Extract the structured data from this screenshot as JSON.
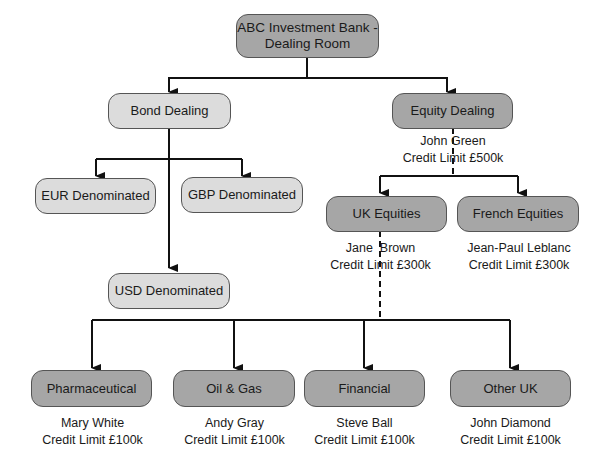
{
  "root": {
    "title_line1": "ABC Investment Bank -",
    "title_line2": "Dealing Room"
  },
  "bond": {
    "title": "Bond Dealing",
    "children": [
      "EUR Denominated",
      "GBP Denominated",
      "USD Denominated"
    ]
  },
  "equity": {
    "title": "Equity Dealing",
    "manager": "John Green",
    "limit": "Credit Limit £500k",
    "uk": {
      "title": "UK Equities",
      "manager": "Jane  Brown",
      "limit": "Credit Limit £300k"
    },
    "french": {
      "title": "French Equities",
      "manager": "Jean-Paul Leblanc",
      "limit": "Credit Limit £300k"
    }
  },
  "sectors": [
    {
      "title": "Pharmaceutical",
      "manager": "Mary White",
      "limit": "Credit Limit £100k"
    },
    {
      "title": "Oil & Gas",
      "manager": "Andy Gray",
      "limit": "Credit Limit £100k"
    },
    {
      "title": "Financial",
      "manager": "Steve Ball",
      "limit": "Credit Limit £100k"
    },
    {
      "title": "Other UK",
      "manager": "John Diamond",
      "limit": "Credit Limit £100k"
    }
  ],
  "colors": {
    "dark_node": "#a6a6a6",
    "light_node": "#dcdcdc",
    "line": "#111111"
  }
}
